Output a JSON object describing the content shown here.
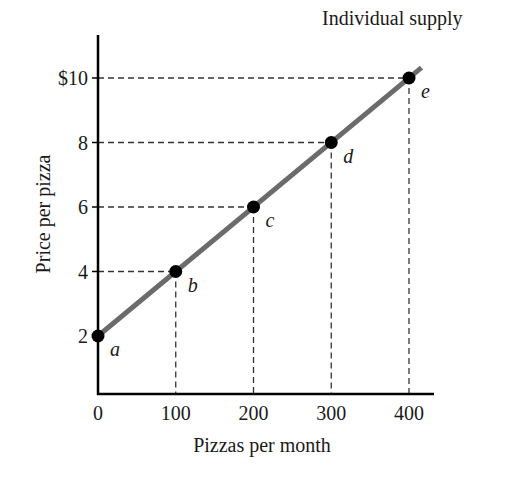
{
  "chart_data": {
    "type": "line",
    "title": "Individual supply",
    "xlabel": "Pizzas per month",
    "ylabel": "Price per pizza",
    "x_ticks": [
      "0",
      "100",
      "200",
      "300",
      "400"
    ],
    "y_ticks": [
      "2",
      "4",
      "6",
      "8",
      "$10"
    ],
    "xlim": [
      0,
      430
    ],
    "ylim": [
      0.5,
      11.5
    ],
    "grid": false,
    "series": [
      {
        "name": "Individual supply",
        "points": [
          {
            "label": "a",
            "x": 0,
            "y": 2
          },
          {
            "label": "b",
            "x": 100,
            "y": 4
          },
          {
            "label": "c",
            "x": 200,
            "y": 6
          },
          {
            "label": "d",
            "x": 300,
            "y": 8
          },
          {
            "label": "e",
            "x": 400,
            "y": 10
          }
        ]
      }
    ],
    "colors": {
      "line": "#6b6b6b",
      "points": "#000000",
      "axes": "#000000",
      "guides": "#333333"
    }
  }
}
